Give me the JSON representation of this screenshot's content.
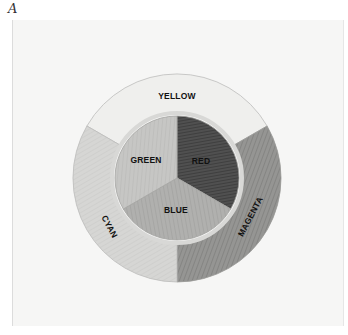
{
  "figure": {
    "panel_label": "A"
  },
  "wheel": {
    "inner_segments": [
      {
        "label": "RED",
        "shade": "#4a4a4a"
      },
      {
        "label": "BLUE",
        "shade": "#a9a9a7"
      },
      {
        "label": "GREEN",
        "shade": "#c2c2c0"
      }
    ],
    "outer_segments": [
      {
        "label": "YELLOW",
        "shade": "#f0f0ee"
      },
      {
        "label": "MAGENTA",
        "shade": "#8f8f8d"
      },
      {
        "label": "CYAN",
        "shade": "#d2d2d0"
      }
    ]
  }
}
